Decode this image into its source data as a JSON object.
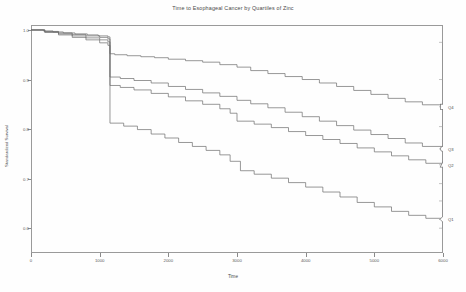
{
  "chart_data": {
    "type": "line",
    "title": "Time to Esophageal Cancer by Quartiles of Zinc",
    "xlabel": "Time",
    "ylabel": "Standardized Survival",
    "grid": false,
    "legend_position": "right-margin",
    "xlim": [
      0,
      6000
    ],
    "ylim": [
      0.55,
      1.01
    ],
    "xticks": [
      0,
      1000,
      2000,
      3000,
      4000,
      5000,
      6000
    ],
    "xtick_labels": [
      "0",
      "1000",
      "2000",
      "3000",
      "4000",
      "5000",
      "6000"
    ],
    "yticks": [
      1.0,
      0.9,
      0.8,
      0.7,
      0.6
    ],
    "ytick_labels": [
      "1.0",
      "0.9",
      "0.8",
      "0.7",
      "0.6"
    ],
    "series": [
      {
        "name": "Q4",
        "color": "#6b6b6b",
        "end_value": 0.845,
        "points": [
          [
            0,
            1.0
          ],
          [
            180,
            0.998
          ],
          [
            320,
            0.996
          ],
          [
            470,
            0.994
          ],
          [
            640,
            0.992
          ],
          [
            820,
            0.99
          ],
          [
            980,
            0.988
          ],
          [
            1120,
            0.986
          ],
          [
            1150,
            0.952
          ],
          [
            1220,
            0.95
          ],
          [
            1400,
            0.948
          ],
          [
            1600,
            0.946
          ],
          [
            1800,
            0.944
          ],
          [
            2000,
            0.941
          ],
          [
            2250,
            0.938
          ],
          [
            2500,
            0.935
          ],
          [
            2750,
            0.93
          ],
          [
            3000,
            0.925
          ],
          [
            3200,
            0.918
          ],
          [
            3450,
            0.912
          ],
          [
            3700,
            0.906
          ],
          [
            3950,
            0.9
          ],
          [
            4200,
            0.893
          ],
          [
            4450,
            0.886
          ],
          [
            4700,
            0.878
          ],
          [
            4950,
            0.87
          ],
          [
            5200,
            0.862
          ],
          [
            5450,
            0.855
          ],
          [
            5700,
            0.849
          ],
          [
            6000,
            0.845
          ]
        ]
      },
      {
        "name": "Q3",
        "color": "#6b6b6b",
        "end_value": 0.76,
        "points": [
          [
            0,
            1.0
          ],
          [
            200,
            0.997
          ],
          [
            400,
            0.994
          ],
          [
            600,
            0.991
          ],
          [
            800,
            0.988
          ],
          [
            1000,
            0.985
          ],
          [
            1120,
            0.982
          ],
          [
            1150,
            0.905
          ],
          [
            1300,
            0.902
          ],
          [
            1500,
            0.898
          ],
          [
            1750,
            0.893
          ],
          [
            2000,
            0.886
          ],
          [
            2250,
            0.88
          ],
          [
            2500,
            0.873
          ],
          [
            2750,
            0.866
          ],
          [
            3000,
            0.858
          ],
          [
            3200,
            0.851
          ],
          [
            3450,
            0.843
          ],
          [
            3700,
            0.834
          ],
          [
            3950,
            0.825
          ],
          [
            4200,
            0.816
          ],
          [
            4450,
            0.807
          ],
          [
            4700,
            0.798
          ],
          [
            4950,
            0.789
          ],
          [
            5200,
            0.781
          ],
          [
            5450,
            0.772
          ],
          [
            5700,
            0.765
          ],
          [
            6000,
            0.76
          ]
        ]
      },
      {
        "name": "Q2",
        "color": "#6b6b6b",
        "end_value": 0.728,
        "points": [
          [
            0,
            1.0
          ],
          [
            200,
            0.996
          ],
          [
            400,
            0.992
          ],
          [
            600,
            0.988
          ],
          [
            800,
            0.984
          ],
          [
            1000,
            0.98
          ],
          [
            1120,
            0.976
          ],
          [
            1150,
            0.888
          ],
          [
            1300,
            0.884
          ],
          [
            1500,
            0.879
          ],
          [
            1750,
            0.872
          ],
          [
            2000,
            0.865
          ],
          [
            2250,
            0.857
          ],
          [
            2500,
            0.85
          ],
          [
            2750,
            0.841
          ],
          [
            2900,
            0.832
          ],
          [
            3000,
            0.816
          ],
          [
            3250,
            0.81
          ],
          [
            3500,
            0.803
          ],
          [
            3750,
            0.795
          ],
          [
            4000,
            0.787
          ],
          [
            4250,
            0.779
          ],
          [
            4500,
            0.771
          ],
          [
            4750,
            0.762
          ],
          [
            5000,
            0.754
          ],
          [
            5250,
            0.746
          ],
          [
            5500,
            0.738
          ],
          [
            5750,
            0.731
          ],
          [
            6000,
            0.728
          ]
        ]
      },
      {
        "name": "Q1",
        "color": "#6b6b6b",
        "end_value": 0.618,
        "points": [
          [
            0,
            1.0
          ],
          [
            200,
            0.995
          ],
          [
            400,
            0.99
          ],
          [
            600,
            0.985
          ],
          [
            800,
            0.98
          ],
          [
            1000,
            0.974
          ],
          [
            1120,
            0.969
          ],
          [
            1150,
            0.812
          ],
          [
            1350,
            0.806
          ],
          [
            1550,
            0.799
          ],
          [
            1750,
            0.79
          ],
          [
            1950,
            0.782
          ],
          [
            2150,
            0.773
          ],
          [
            2350,
            0.765
          ],
          [
            2550,
            0.757
          ],
          [
            2750,
            0.748
          ],
          [
            2900,
            0.735
          ],
          [
            3050,
            0.716
          ],
          [
            3250,
            0.709
          ],
          [
            3500,
            0.701
          ],
          [
            3750,
            0.692
          ],
          [
            4000,
            0.683
          ],
          [
            4250,
            0.673
          ],
          [
            4500,
            0.663
          ],
          [
            4750,
            0.652
          ],
          [
            5000,
            0.643
          ],
          [
            5250,
            0.634
          ],
          [
            5500,
            0.626
          ],
          [
            5750,
            0.62
          ],
          [
            6000,
            0.618
          ]
        ]
      }
    ],
    "error_bar": {
      "x": 6000,
      "top": 0.975,
      "bottom": 0.6,
      "markers": [
        {
          "label": "Q4",
          "value": 0.845,
          "shape": "square"
        },
        {
          "label": "Q3",
          "value": 0.76,
          "shape": "circle"
        },
        {
          "label": "Q2",
          "value": 0.728,
          "shape": "triangle"
        },
        {
          "label": "Q1",
          "value": 0.618,
          "shape": "diamond"
        }
      ],
      "ticks": [
        0.975,
        0.9,
        0.845,
        0.805,
        0.76,
        0.728,
        0.69,
        0.655,
        0.618,
        0.6
      ]
    }
  }
}
